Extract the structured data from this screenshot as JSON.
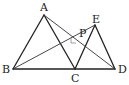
{
  "diagram": {
    "type": "geometry",
    "points": {
      "A": {
        "label": "A",
        "x": 44,
        "y": 15
      },
      "B": {
        "label": "B",
        "x": 13,
        "y": 69
      },
      "C": {
        "label": "C",
        "x": 75,
        "y": 69
      },
      "D": {
        "label": "D",
        "x": 115,
        "y": 69
      },
      "E": {
        "label": "E",
        "x": 95,
        "y": 25
      },
      "P": {
        "label": "P",
        "x": 77,
        "y": 40
      }
    },
    "segments": [
      "AB",
      "AC",
      "BD",
      "CE",
      "ED",
      "AD",
      "BE"
    ],
    "annotations": [
      "right-angle-mark-near-P"
    ]
  }
}
